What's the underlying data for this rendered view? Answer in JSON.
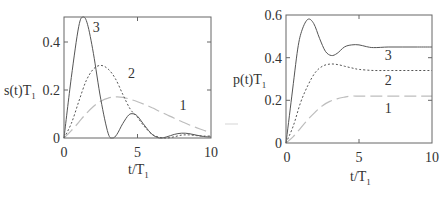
{
  "chart_data": [
    {
      "type": "line",
      "panel": "left",
      "title": "",
      "xlabel": "t/T1",
      "ylabel": "s(t)T1",
      "xlim": [
        0,
        10
      ],
      "ylim": [
        0,
        0.5
      ],
      "xticks": [
        0,
        5,
        10
      ],
      "yticks": [
        0,
        0.2,
        0.4
      ],
      "xtick_labels": [
        "0",
        "5",
        "10"
      ],
      "ytick_labels": [
        "0",
        "0.2",
        "0.4"
      ],
      "grid": false,
      "legend": "inline curve labels",
      "series": [
        {
          "name": "1",
          "style": "long-dash",
          "color": "#bdbdbd",
          "label_pos": [
            8.1,
            0.115
          ],
          "x": [
            0,
            0.5,
            1,
            1.5,
            2,
            2.5,
            3,
            3.5,
            4,
            4.5,
            5,
            5.5,
            6,
            6.5,
            7,
            7.5,
            8,
            8.5,
            9,
            9.5,
            10
          ],
          "y": [
            0,
            0.03,
            0.065,
            0.1,
            0.13,
            0.152,
            0.165,
            0.17,
            0.168,
            0.16,
            0.15,
            0.138,
            0.125,
            0.11,
            0.096,
            0.082,
            0.068,
            0.055,
            0.043,
            0.032,
            0.022
          ]
        },
        {
          "name": "2",
          "style": "dotted",
          "color": "#555555",
          "label_pos": [
            4.6,
            0.25
          ],
          "x": [
            0,
            0.5,
            1,
            1.5,
            2,
            2.5,
            3,
            3.5,
            4,
            4.5,
            5,
            5.5,
            6,
            6.5,
            7,
            7.5,
            8,
            8.5,
            9,
            9.5,
            10
          ],
          "y": [
            0,
            0.06,
            0.15,
            0.235,
            0.285,
            0.3,
            0.285,
            0.245,
            0.18,
            0.12,
            0.085,
            0.045,
            0.015,
            0.003,
            0.0,
            0.005,
            0.012,
            0.013,
            0.01,
            0.008,
            0.008
          ]
        },
        {
          "name": "3",
          "style": "solid",
          "color": "#555555",
          "label_pos": [
            2.2,
            0.44
          ],
          "x": [
            0,
            0.5,
            1,
            1.3,
            1.6,
            2,
            2.5,
            3,
            3.3,
            3.6,
            4,
            4.4,
            4.7,
            5,
            5.5,
            6,
            6.5,
            7,
            7.5,
            8,
            8.5,
            9,
            9.5,
            10
          ],
          "y": [
            0,
            0.25,
            0.46,
            0.5,
            0.47,
            0.35,
            0.16,
            0.02,
            0.0,
            0.015,
            0.06,
            0.095,
            0.1,
            0.09,
            0.05,
            0.015,
            0.0,
            0.005,
            0.015,
            0.02,
            0.018,
            0.012,
            0.006,
            0.004
          ]
        }
      ]
    },
    {
      "type": "line",
      "panel": "right",
      "title": "",
      "xlabel": "t/T1",
      "ylabel": "p(t)T1",
      "xlim": [
        0,
        10
      ],
      "ylim": [
        0,
        0.6
      ],
      "xticks": [
        0,
        5,
        10
      ],
      "yticks": [
        0,
        0.2,
        0.4,
        0.6
      ],
      "xtick_labels": [
        "0",
        "5",
        "10"
      ],
      "ytick_labels": [
        "0",
        "0.2",
        "0.4",
        "0.6"
      ],
      "grid": false,
      "legend": "inline curve labels",
      "series": [
        {
          "name": "1",
          "style": "long-dash",
          "color": "#bdbdbd",
          "label_pos": [
            7.0,
            0.14
          ],
          "x": [
            0,
            0.5,
            1,
            1.5,
            2,
            2.5,
            3,
            3.5,
            4,
            4.5,
            5,
            6,
            7,
            8,
            9,
            10
          ],
          "y": [
            0,
            0.03,
            0.07,
            0.11,
            0.145,
            0.175,
            0.195,
            0.207,
            0.215,
            0.22,
            0.22,
            0.22,
            0.22,
            0.22,
            0.22,
            0.22
          ]
        },
        {
          "name": "2",
          "style": "dotted",
          "color": "#555555",
          "label_pos": [
            7.0,
            0.27
          ],
          "x": [
            0,
            0.5,
            1,
            1.5,
            2,
            2.5,
            3,
            3.5,
            4,
            4.5,
            5,
            6,
            7,
            8,
            9,
            10
          ],
          "y": [
            0,
            0.08,
            0.19,
            0.27,
            0.33,
            0.36,
            0.37,
            0.368,
            0.36,
            0.352,
            0.345,
            0.34,
            0.34,
            0.34,
            0.34,
            0.34
          ]
        },
        {
          "name": "3",
          "style": "solid",
          "color": "#555555",
          "label_pos": [
            7.0,
            0.39
          ],
          "x": [
            0,
            0.4,
            0.8,
            1.1,
            1.5,
            1.9,
            2.3,
            2.7,
            3.1,
            3.5,
            4,
            4.5,
            5,
            5.5,
            6,
            7,
            8,
            9,
            10
          ],
          "y": [
            0,
            0.22,
            0.44,
            0.53,
            0.58,
            0.56,
            0.49,
            0.43,
            0.41,
            0.42,
            0.45,
            0.46,
            0.46,
            0.452,
            0.447,
            0.45,
            0.45,
            0.45,
            0.45
          ]
        }
      ]
    }
  ],
  "panels": {
    "left": {
      "ylabel_main": "s(t)T",
      "ylabel_sub": "1",
      "xlabel_main": "t/T",
      "xlabel_sub": "1",
      "ytick_labels": [
        "0",
        "0.2",
        "0.4"
      ],
      "xtick_labels": [
        "0",
        "5",
        "10"
      ],
      "curve_labels": [
        "1",
        "2",
        "3"
      ]
    },
    "right": {
      "ylabel_main": "p(t)T",
      "ylabel_sub": "1",
      "xlabel_main": "t/T",
      "xlabel_sub": "1",
      "ytick_labels": [
        "0",
        "0.2",
        "0.4",
        "0.6"
      ],
      "xtick_labels": [
        "0",
        "5",
        "10"
      ],
      "curve_labels": [
        "1",
        "2",
        "3"
      ]
    }
  }
}
